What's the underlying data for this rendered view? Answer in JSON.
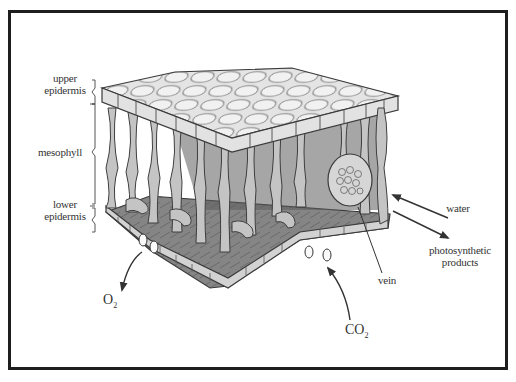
{
  "diagram": {
    "structure_labels": {
      "upper_epidermis": [
        "upper",
        "epidermis"
      ],
      "mesophyll": "mesophyll",
      "lower_epidermis": [
        "lower",
        "epidermis"
      ]
    },
    "side_labels": {
      "water": "water",
      "photosynthetic_products": [
        "photosynthetic",
        "products"
      ],
      "vein": "vein"
    },
    "gases": {
      "o2": {
        "base": "O",
        "sub": "2"
      },
      "co2": {
        "base": "CO",
        "sub": "2"
      }
    },
    "colors": {
      "frame": "#1e1e1e",
      "line": "#3a3a3a",
      "cell_light": "#e6e6e6",
      "cell_mid": "#b9b9b9",
      "cell_dark": "#6e6e6e",
      "floor": "#7d7d7d"
    }
  }
}
